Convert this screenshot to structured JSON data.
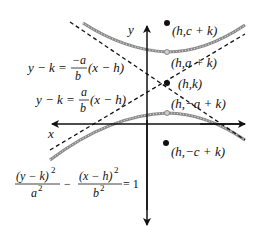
{
  "diagram": {
    "axes": {
      "x_label": "x",
      "y_label": "y"
    },
    "points": [
      {
        "id": "focus-top",
        "label": "(h,c + k)"
      },
      {
        "id": "vertex-top",
        "label": "(h,a + k)"
      },
      {
        "id": "center",
        "label": "(h,k)"
      },
      {
        "id": "vertex-bottom",
        "label": "(h,−a + k)"
      },
      {
        "id": "focus-bottom",
        "label": "(h,−c + k)"
      }
    ],
    "asymptotes": [
      {
        "id": "negative-slope",
        "lhs": "y − k =",
        "num": "−a",
        "den": "b",
        "rhs": "(x − h)"
      },
      {
        "id": "positive-slope",
        "lhs": "y − k =",
        "num": "a",
        "den": "b",
        "rhs": "(x − h)"
      }
    ],
    "equation": {
      "term1_num": "(y − k)",
      "term1_num_exp": "2",
      "term1_den": "a",
      "term1_den_exp": "2",
      "minus": "−",
      "term2_num": "(x − h)",
      "term2_num_exp": "2",
      "term2_den": "b",
      "term2_den_exp": "2",
      "equals": "= 1"
    },
    "colors": {
      "ink": "#111111",
      "curve": "#9a9a9a",
      "vertex_marker": "#a0a0a0"
    }
  }
}
